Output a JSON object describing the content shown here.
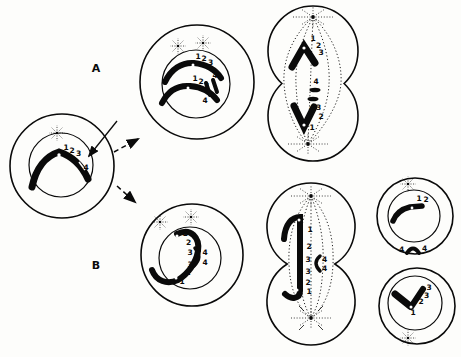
{
  "colors": {
    "ink": "#0a0a0a",
    "paper": "#fdfdfb"
  },
  "branches": {
    "a_label": "A",
    "b_label": "B"
  },
  "origin_cell": {
    "segments": [
      "1",
      "2",
      "3",
      "4"
    ]
  },
  "a_prophase_cell": {
    "chromatid_top": [
      "1",
      "2",
      "3"
    ],
    "chromatid_bottom": [
      "1",
      "2",
      "3"
    ],
    "fragments": [
      "4",
      "4"
    ]
  },
  "a_anaphase_cell": {
    "upper_chromosome": [
      "1",
      "2",
      "3"
    ],
    "fragments": [
      "4",
      "4"
    ],
    "lower_chromosome": [
      "3",
      "2",
      "1"
    ]
  },
  "b_prophase_cell": {
    "dicentric_loop": [
      "1",
      "2",
      "3",
      "3",
      "2",
      "1"
    ],
    "fragments": [
      "4",
      "4"
    ]
  },
  "b_anaphase_cell": {
    "bridge": [
      "1",
      "2",
      "3",
      "3",
      "2",
      "1"
    ],
    "fragments": [
      "4",
      "4"
    ]
  },
  "b_daughter_top_cell": {
    "segments": [
      "1",
      "2"
    ],
    "fragments": [
      "4",
      "4"
    ]
  },
  "b_daughter_bottom_cell": {
    "segments": [
      "3",
      "3",
      "2",
      "1"
    ]
  }
}
